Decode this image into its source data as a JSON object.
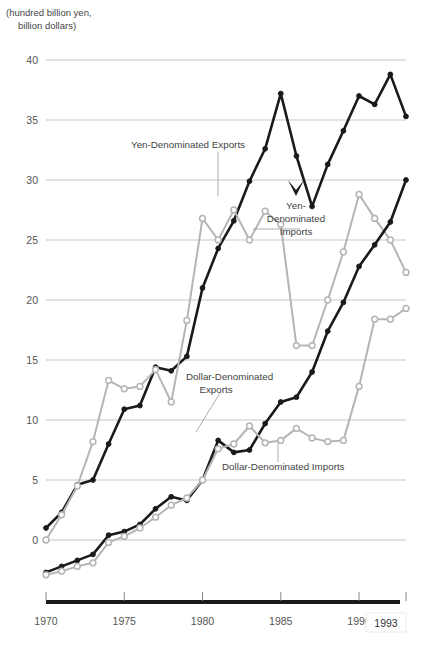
{
  "figure": {
    "unit_label_line1": "(hundred billion yen,",
    "unit_label_line2": "billion dollars)"
  },
  "annotations": {
    "yen_exports": "Yen-Denominated Exports",
    "yen_imports_l1": "Yen-",
    "yen_imports_l2": "Denominated",
    "yen_imports_l3": "Imports",
    "dollar_exports_l1": "Dollar-Denominated",
    "dollar_exports_l2": "Exports",
    "dollar_imports": "Dollar-Denominated Imports"
  },
  "chart_data": {
    "type": "line",
    "title": "",
    "xlabel": "",
    "ylabel": "(hundred billion yen, billion dollars)",
    "xlim": [
      1970,
      1993
    ],
    "ylim": [
      -3.5,
      41
    ],
    "yticks": [
      0,
      5,
      10,
      15,
      20,
      25,
      30,
      35,
      40
    ],
    "xticks": [
      1970,
      1975,
      1980,
      1985,
      1990,
      1993
    ],
    "xtick_labels": [
      "1970",
      "1975",
      "1980",
      "1985",
      "1990",
      "1993"
    ],
    "grid": "horizontal",
    "legend": "inline-annotations",
    "colors": {
      "dark": "#1a1a1a",
      "light": "#b5b5b5",
      "grid": "#b9b9b9",
      "text": "#444444"
    },
    "x": [
      1970,
      1971,
      1972,
      1973,
      1974,
      1975,
      1976,
      1977,
      1978,
      1979,
      1980,
      1981,
      1982,
      1983,
      1984,
      1985,
      1986,
      1987,
      1988,
      1989,
      1990,
      1991,
      1992,
      1993
    ],
    "series": [
      {
        "name": "Yen-Denominated Exports",
        "style": "dark-filled",
        "values": [
          1.0,
          2.3,
          4.6,
          5.0,
          8.0,
          10.9,
          11.2,
          14.4,
          14.1,
          15.3,
          21.0,
          24.3,
          26.6,
          29.9,
          32.6,
          37.2,
          32.0,
          27.8,
          31.3,
          34.1,
          37.0,
          36.3,
          38.8,
          35.3
        ]
      },
      {
        "name": "Yen-Denominated Imports",
        "style": "light-open",
        "values": [
          0.0,
          2.1,
          4.5,
          8.2,
          13.3,
          12.6,
          12.8,
          14.2,
          11.5,
          18.3,
          26.8,
          25.0,
          27.5,
          25.0,
          27.4,
          26.3,
          16.2,
          16.2,
          20.0,
          24.0,
          28.8,
          26.8,
          25.0,
          22.3
        ]
      },
      {
        "name": "Dollar-Denominated Exports",
        "style": "dark-filled",
        "values": [
          -2.7,
          -2.2,
          -1.7,
          -1.2,
          0.4,
          0.7,
          1.3,
          2.6,
          3.6,
          3.3,
          5.0,
          8.3,
          7.3,
          7.5,
          9.7,
          11.5,
          11.9,
          14.0,
          17.4,
          19.8,
          22.8,
          24.6,
          26.5,
          30.0
        ]
      },
      {
        "name": "Dollar-Denominated Imports",
        "style": "light-open",
        "values": [
          -2.9,
          -2.6,
          -2.2,
          -1.9,
          -0.2,
          0.3,
          1.0,
          1.9,
          2.9,
          3.5,
          5.0,
          7.6,
          8.0,
          9.5,
          8.1,
          8.3,
          9.3,
          8.5,
          8.2,
          8.3,
          12.8,
          18.4,
          18.4,
          19.3
        ]
      }
    ]
  }
}
